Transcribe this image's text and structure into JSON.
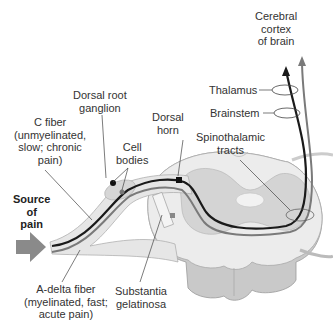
{
  "diagram": {
    "labels": {
      "cerebral_cortex": [
        "Cerebral",
        "cortex",
        "of brain"
      ],
      "thalamus": "Thalamus",
      "brainstem": "Brainstem",
      "spinothalamic": [
        "Spinothalamic",
        "tracts"
      ],
      "dorsal_root_ganglion": [
        "Dorsal root",
        "ganglion"
      ],
      "dorsal_horn": [
        "Dorsal",
        "horn"
      ],
      "c_fiber": [
        "C fiber",
        "(unmyelinated,",
        "slow; chronic",
        "pain)"
      ],
      "cell_bodies": [
        "Cell",
        "bodies"
      ],
      "source_of_pain": [
        "Source",
        "of",
        "pain"
      ],
      "a_delta_fiber": [
        "A-delta fiber",
        "(myelinated, fast;",
        "acute pain)"
      ],
      "substantia_gelatinosa": [
        "Substantia",
        "gelatinosa"
      ]
    },
    "colors": {
      "c_fiber": "#1a1a1a",
      "a_delta_fiber": "#7a7a7a",
      "cord_white_matter": "#e8e8e8",
      "cord_gray_matter": "#d0d0d0",
      "arrow": "#8a8a8a"
    }
  }
}
